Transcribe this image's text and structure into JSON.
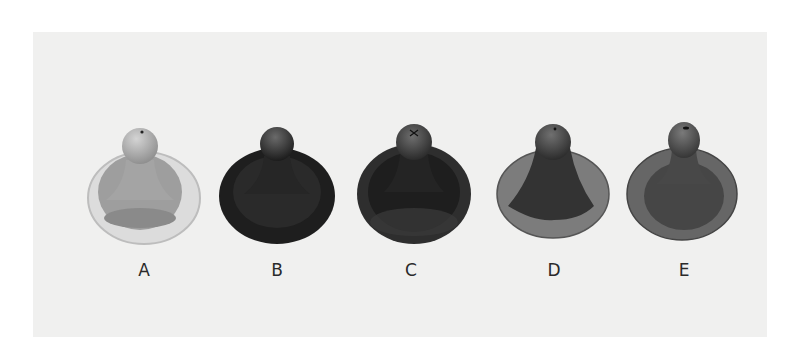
{
  "figure": {
    "items": [
      {
        "label": "A",
        "tone": "light",
        "fill": "#a8a8a8",
        "flange": "#d8d8d8"
      },
      {
        "label": "B",
        "tone": "dark",
        "fill": "#2b2b2b",
        "flange": "#222222"
      },
      {
        "label": "C",
        "tone": "dark",
        "fill": "#303030",
        "flange": "#3a3a3a"
      },
      {
        "label": "D",
        "tone": "dark-with-light-flange",
        "fill": "#3c3c3c",
        "flange": "#7a7a7a"
      },
      {
        "label": "E",
        "tone": "medium",
        "fill": "#4a4a4a",
        "flange": "#6a6a6a"
      }
    ]
  }
}
